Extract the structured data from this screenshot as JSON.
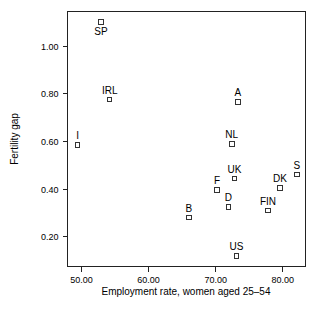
{
  "chart_data": {
    "type": "scatter",
    "title": "",
    "xlabel": "Employment rate, women aged 25–54",
    "ylabel": "Fertility gap",
    "xlim": [
      47.9,
      83.4
    ],
    "ylim": [
      0.075,
      1.145
    ],
    "grid": false,
    "legend": "none",
    "xticks": [
      50.0,
      60.0,
      70.0,
      80.0
    ],
    "xtick_labels": [
      "50.00",
      "60.00",
      "70.00",
      "80.00"
    ],
    "yticks": [
      0.2,
      0.4,
      0.6,
      0.8,
      1.0
    ],
    "ytick_labels": [
      "0.20",
      "0.40",
      "0.60",
      "0.80",
      "1.00"
    ],
    "marker": "open-square",
    "marker_color": "#333333",
    "points": [
      {
        "label": "SP",
        "x": 52.9,
        "y": 1.1,
        "label_pos": "below"
      },
      {
        "label": "IRL",
        "x": 54.2,
        "y": 0.775,
        "label_pos": "above"
      },
      {
        "label": "I",
        "x": 49.4,
        "y": 0.585,
        "label_pos": "above"
      },
      {
        "label": "A",
        "x": 73.3,
        "y": 0.765,
        "label_pos": "above"
      },
      {
        "label": "NL",
        "x": 72.4,
        "y": 0.59,
        "label_pos": "above"
      },
      {
        "label": "UK",
        "x": 72.8,
        "y": 0.445,
        "label_pos": "above"
      },
      {
        "label": "S",
        "x": 82.1,
        "y": 0.46,
        "label_pos": "above"
      },
      {
        "label": "DK",
        "x": 79.6,
        "y": 0.405,
        "label_pos": "above"
      },
      {
        "label": "F",
        "x": 70.2,
        "y": 0.395,
        "label_pos": "above"
      },
      {
        "label": "D",
        "x": 71.9,
        "y": 0.325,
        "label_pos": "above"
      },
      {
        "label": "FIN",
        "x": 77.8,
        "y": 0.31,
        "label_pos": "above"
      },
      {
        "label": "B",
        "x": 66.0,
        "y": 0.28,
        "label_pos": "above"
      },
      {
        "label": "US",
        "x": 73.1,
        "y": 0.12,
        "label_pos": "above"
      }
    ]
  }
}
